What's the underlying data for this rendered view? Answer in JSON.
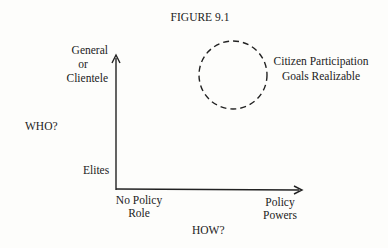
{
  "figure": {
    "title": "FIGURE 9.1"
  },
  "y_axis": {
    "label": "WHO?",
    "top_label": [
      "General",
      "or",
      "Clientele"
    ],
    "bottom_label": "Elites"
  },
  "x_axis": {
    "label": "HOW?",
    "left_label": [
      "No Policy",
      "Role"
    ],
    "right_label": [
      "Policy",
      "Powers"
    ]
  },
  "region": {
    "label": [
      "Citizen Participation",
      "Goals Realizable"
    ],
    "shape": "dashed-circle"
  }
}
